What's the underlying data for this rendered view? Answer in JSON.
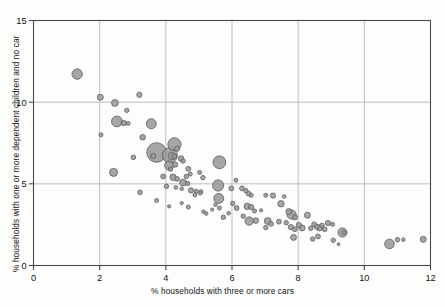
{
  "chart_data": {
    "type": "scatter",
    "title": "",
    "xlabel": "% households with three or more cars",
    "ylabel": "% households with one or more dependent children and no car",
    "xlim": [
      0,
      12
    ],
    "ylim": [
      0,
      15
    ],
    "xticks": [
      0,
      2,
      4,
      6,
      8,
      10,
      12
    ],
    "yticks": [
      0,
      5,
      10,
      15
    ],
    "grid": true,
    "legend": "none",
    "marker": {
      "shape": "circle",
      "fill": "#9a9a9a",
      "stroke": "#5c5c5c",
      "opacity": 0.88,
      "size_encodes": "bubble area (third variable)"
    },
    "points": [
      {
        "x": 1.32,
        "y": 11.72,
        "r": 5.2
      },
      {
        "x": 2.02,
        "y": 10.3,
        "r": 3.0
      },
      {
        "x": 2.46,
        "y": 9.95,
        "r": 3.4
      },
      {
        "x": 3.2,
        "y": 10.45,
        "r": 2.6
      },
      {
        "x": 2.82,
        "y": 9.5,
        "r": 2.2
      },
      {
        "x": 2.52,
        "y": 8.82,
        "r": 5.4
      },
      {
        "x": 2.73,
        "y": 8.72,
        "r": 2.6
      },
      {
        "x": 2.86,
        "y": 8.7,
        "r": 2.0
      },
      {
        "x": 2.04,
        "y": 8.0,
        "r": 2.0
      },
      {
        "x": 3.56,
        "y": 8.68,
        "r": 5.0
      },
      {
        "x": 3.3,
        "y": 7.85,
        "r": 2.8
      },
      {
        "x": 4.26,
        "y": 7.42,
        "r": 6.6
      },
      {
        "x": 4.34,
        "y": 7.15,
        "r": 2.6
      },
      {
        "x": 3.72,
        "y": 6.92,
        "r": 9.8
      },
      {
        "x": 3.62,
        "y": 6.7,
        "r": 2.6
      },
      {
        "x": 4.12,
        "y": 6.75,
        "r": 7.6
      },
      {
        "x": 4.18,
        "y": 6.7,
        "r": 3.6
      },
      {
        "x": 4.26,
        "y": 6.68,
        "r": 2.4
      },
      {
        "x": 3.02,
        "y": 6.62,
        "r": 2.3
      },
      {
        "x": 4.46,
        "y": 6.55,
        "r": 2.8
      },
      {
        "x": 4.52,
        "y": 6.4,
        "r": 2.2
      },
      {
        "x": 4.1,
        "y": 6.12,
        "r": 4.6
      },
      {
        "x": 4.28,
        "y": 6.18,
        "r": 2.6
      },
      {
        "x": 4.14,
        "y": 5.9,
        "r": 2.2
      },
      {
        "x": 5.62,
        "y": 6.32,
        "r": 6.4
      },
      {
        "x": 4.68,
        "y": 5.92,
        "r": 2.4
      },
      {
        "x": 3.92,
        "y": 5.45,
        "r": 2.4
      },
      {
        "x": 2.42,
        "y": 5.7,
        "r": 4.0
      },
      {
        "x": 4.22,
        "y": 5.4,
        "r": 3.2
      },
      {
        "x": 4.34,
        "y": 5.3,
        "r": 2.4
      },
      {
        "x": 4.62,
        "y": 5.45,
        "r": 2.2
      },
      {
        "x": 4.74,
        "y": 5.6,
        "r": 2.0
      },
      {
        "x": 5.02,
        "y": 5.7,
        "r": 2.0
      },
      {
        "x": 5.12,
        "y": 5.38,
        "r": 2.2
      },
      {
        "x": 4.52,
        "y": 5.08,
        "r": 3.4
      },
      {
        "x": 4.66,
        "y": 5.02,
        "r": 2.2
      },
      {
        "x": 5.58,
        "y": 4.9,
        "r": 5.6
      },
      {
        "x": 3.22,
        "y": 4.48,
        "r": 2.4
      },
      {
        "x": 4.02,
        "y": 4.85,
        "r": 2.2
      },
      {
        "x": 4.3,
        "y": 4.78,
        "r": 1.8
      },
      {
        "x": 4.48,
        "y": 4.7,
        "r": 1.8
      },
      {
        "x": 4.76,
        "y": 4.6,
        "r": 2.6
      },
      {
        "x": 4.92,
        "y": 4.55,
        "r": 2.0
      },
      {
        "x": 5.06,
        "y": 4.52,
        "r": 2.0
      },
      {
        "x": 5.6,
        "y": 4.1,
        "r": 5.0
      },
      {
        "x": 5.98,
        "y": 4.72,
        "r": 2.4
      },
      {
        "x": 6.12,
        "y": 5.22,
        "r": 2.0
      },
      {
        "x": 6.3,
        "y": 4.72,
        "r": 2.4
      },
      {
        "x": 6.42,
        "y": 4.58,
        "r": 2.2
      },
      {
        "x": 6.5,
        "y": 4.4,
        "r": 2.4
      },
      {
        "x": 6.58,
        "y": 4.3,
        "r": 2.0
      },
      {
        "x": 7.02,
        "y": 4.3,
        "r": 2.0
      },
      {
        "x": 7.24,
        "y": 4.28,
        "r": 2.6
      },
      {
        "x": 7.58,
        "y": 4.22,
        "r": 1.8
      },
      {
        "x": 3.72,
        "y": 3.98,
        "r": 2.0
      },
      {
        "x": 4.1,
        "y": 3.62,
        "r": 1.6
      },
      {
        "x": 4.48,
        "y": 3.82,
        "r": 1.6
      },
      {
        "x": 4.68,
        "y": 3.58,
        "r": 2.0
      },
      {
        "x": 4.88,
        "y": 4.32,
        "r": 2.0
      },
      {
        "x": 5.04,
        "y": 4.42,
        "r": 1.8
      },
      {
        "x": 5.14,
        "y": 3.3,
        "r": 1.8
      },
      {
        "x": 5.22,
        "y": 3.18,
        "r": 1.8
      },
      {
        "x": 5.4,
        "y": 3.42,
        "r": 1.6
      },
      {
        "x": 5.5,
        "y": 3.72,
        "r": 1.8
      },
      {
        "x": 5.62,
        "y": 3.52,
        "r": 2.0
      },
      {
        "x": 5.74,
        "y": 2.95,
        "r": 2.2
      },
      {
        "x": 5.9,
        "y": 3.2,
        "r": 1.8
      },
      {
        "x": 6.02,
        "y": 3.8,
        "r": 2.2
      },
      {
        "x": 6.14,
        "y": 3.52,
        "r": 2.4
      },
      {
        "x": 6.46,
        "y": 3.62,
        "r": 3.2
      },
      {
        "x": 6.58,
        "y": 3.58,
        "r": 2.6
      },
      {
        "x": 6.68,
        "y": 3.34,
        "r": 2.0
      },
      {
        "x": 6.34,
        "y": 3.02,
        "r": 2.2
      },
      {
        "x": 6.52,
        "y": 2.72,
        "r": 4.2
      },
      {
        "x": 6.72,
        "y": 2.75,
        "r": 2.8
      },
      {
        "x": 6.88,
        "y": 3.38,
        "r": 1.6
      },
      {
        "x": 7.08,
        "y": 2.72,
        "r": 3.4
      },
      {
        "x": 7.18,
        "y": 2.55,
        "r": 2.4
      },
      {
        "x": 7.02,
        "y": 2.32,
        "r": 2.2
      },
      {
        "x": 7.42,
        "y": 2.68,
        "r": 2.4
      },
      {
        "x": 7.48,
        "y": 3.78,
        "r": 3.2
      },
      {
        "x": 7.72,
        "y": 3.3,
        "r": 3.0
      },
      {
        "x": 7.8,
        "y": 3.12,
        "r": 4.6
      },
      {
        "x": 7.9,
        "y": 2.95,
        "r": 2.6
      },
      {
        "x": 7.64,
        "y": 2.62,
        "r": 2.2
      },
      {
        "x": 7.78,
        "y": 2.35,
        "r": 2.6
      },
      {
        "x": 7.9,
        "y": 2.22,
        "r": 2.4
      },
      {
        "x": 8.02,
        "y": 2.48,
        "r": 2.6
      },
      {
        "x": 8.12,
        "y": 2.3,
        "r": 3.0
      },
      {
        "x": 7.86,
        "y": 1.72,
        "r": 3.0
      },
      {
        "x": 8.28,
        "y": 3.08,
        "r": 3.0
      },
      {
        "x": 8.38,
        "y": 2.28,
        "r": 2.2
      },
      {
        "x": 8.48,
        "y": 2.52,
        "r": 2.4
      },
      {
        "x": 8.56,
        "y": 2.38,
        "r": 2.6
      },
      {
        "x": 8.64,
        "y": 2.3,
        "r": 3.0
      },
      {
        "x": 8.72,
        "y": 2.46,
        "r": 2.2
      },
      {
        "x": 8.8,
        "y": 2.22,
        "r": 2.4
      },
      {
        "x": 8.6,
        "y": 1.78,
        "r": 2.4
      },
      {
        "x": 8.9,
        "y": 2.6,
        "r": 2.6
      },
      {
        "x": 9.04,
        "y": 2.52,
        "r": 2.0
      },
      {
        "x": 8.44,
        "y": 1.62,
        "r": 2.2
      },
      {
        "x": 9.06,
        "y": 1.55,
        "r": 2.2
      },
      {
        "x": 9.34,
        "y": 2.02,
        "r": 4.6
      },
      {
        "x": 9.38,
        "y": 2.02,
        "r": 2.0
      },
      {
        "x": 9.22,
        "y": 1.3,
        "r": 1.4
      },
      {
        "x": 10.76,
        "y": 1.32,
        "r": 4.8
      },
      {
        "x": 11.0,
        "y": 1.58,
        "r": 2.2
      },
      {
        "x": 11.18,
        "y": 1.58,
        "r": 1.8
      },
      {
        "x": 11.78,
        "y": 1.6,
        "r": 3.0
      }
    ]
  },
  "axes": {
    "x_tick_labels": [
      "0",
      "2",
      "4",
      "6",
      "8",
      "10",
      "12"
    ],
    "y_tick_labels": [
      "0",
      "5",
      "10",
      "15"
    ],
    "x_title": "% households with three or more cars",
    "y_title": "% households with one or more dependent children and no car"
  },
  "colors": {
    "marker_fill": "#9a9a9a",
    "marker_stroke": "#5c5c5c",
    "grid": "#b8b8b8",
    "axis": "#4a4a4a",
    "background": "#fdfdfc",
    "text": "#111111"
  }
}
